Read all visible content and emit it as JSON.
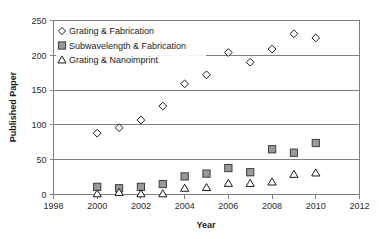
{
  "chart_data": {
    "type": "scatter",
    "title": "",
    "xlabel": "Year",
    "ylabel": "Published Paper",
    "xlim": [
      1998,
      2012
    ],
    "ylim": [
      0,
      250
    ],
    "xticks": [
      1998,
      2000,
      2002,
      2004,
      2006,
      2008,
      2010,
      2012
    ],
    "yticks": [
      0,
      50,
      100,
      150,
      200,
      250
    ],
    "grid": "horizontal",
    "legend_position": "top-left",
    "x": [
      2000,
      2001,
      2002,
      2003,
      2004,
      2005,
      2006,
      2007,
      2008,
      2009,
      2010
    ],
    "series": [
      {
        "name": "Grating & Fabrication",
        "marker": "diamond",
        "fill": "#ffffff",
        "stroke": "#1a1a1a",
        "values": [
          88,
          96,
          107,
          127,
          159,
          172,
          204,
          190,
          209,
          231,
          225
        ]
      },
      {
        "name": "Subwavelength & Fabrication",
        "marker": "square",
        "fill": "#9a9a9a",
        "stroke": "#3a3a3a",
        "values": [
          11,
          9,
          11,
          15,
          26,
          30,
          38,
          32,
          65,
          60,
          74
        ]
      },
      {
        "name": "Grating & Nanoimprint",
        "marker": "triangle",
        "fill": "#ffffff",
        "stroke": "#1a1a1a",
        "values": [
          1,
          3,
          1,
          1,
          9,
          10,
          16,
          16,
          18,
          29,
          31
        ]
      }
    ]
  },
  "legend": {
    "items": [
      {
        "label": "Grating & Fabrication",
        "marker": "diamond"
      },
      {
        "label": "Subwavelength & Fabrication",
        "marker": "square"
      },
      {
        "label": "Grating & Nanoimprint",
        "marker": "triangle"
      }
    ]
  },
  "axes": {
    "x_title": "Year",
    "y_title": "Published Paper",
    "x_tick_labels": [
      "1998",
      "2000",
      "2002",
      "2004",
      "2006",
      "2008",
      "2010",
      "2012"
    ],
    "y_tick_labels": [
      "0",
      "50",
      "100",
      "150",
      "200",
      "250"
    ]
  },
  "colors": {
    "axis": "#808080",
    "grid": "#808080",
    "text": "#1a1a1a",
    "square_fill": "#9a9a9a",
    "marker_outline": "#1a1a1a",
    "background": "#ffffff"
  }
}
